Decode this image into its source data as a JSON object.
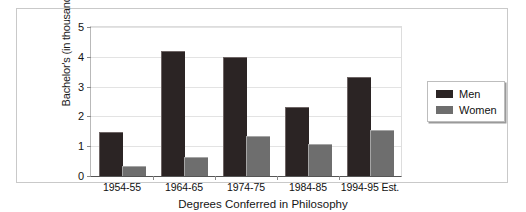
{
  "chart_data": {
    "type": "bar",
    "title": "",
    "caption": "Degrees Conferred in Philosophy",
    "xlabel": "",
    "ylabel": "Bachelor's (in thousands)",
    "categories": [
      "1954-55",
      "1964-65",
      "1974-75",
      "1984-85",
      "1994-95 Est."
    ],
    "series": [
      {
        "name": "Men",
        "color": "#2b2424",
        "values": [
          1.45,
          4.15,
          3.97,
          2.28,
          3.3
        ]
      },
      {
        "name": "Women",
        "color": "#6e6e6e",
        "values": [
          0.3,
          0.62,
          1.32,
          1.05,
          1.5
        ]
      }
    ],
    "ylim": [
      0,
      5
    ],
    "yticks": [
      0,
      1,
      2,
      3,
      4,
      5
    ],
    "ytick_labels": [
      "0",
      "1",
      "2",
      "3",
      "4",
      "5"
    ],
    "grid": true,
    "legend_position": "right",
    "legend_entries": [
      "Men",
      "Women"
    ]
  }
}
